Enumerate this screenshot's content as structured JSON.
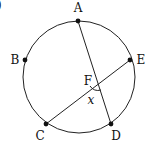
{
  "diagram": {
    "type": "circle-chords",
    "stroke_color": "#222222",
    "circle": {
      "cx": 79,
      "cy": 77,
      "r": 56
    },
    "points": [
      {
        "id": "A",
        "label": "A",
        "x": 78,
        "y": 21,
        "lx": 78,
        "ly": 12
      },
      {
        "id": "B",
        "label": "B",
        "x": 25,
        "y": 60,
        "lx": 15,
        "ly": 64
      },
      {
        "id": "E",
        "label": "E",
        "x": 130,
        "y": 60,
        "lx": 141,
        "ly": 64
      },
      {
        "id": "C",
        "label": "C",
        "x": 46,
        "y": 124,
        "lx": 40,
        "ly": 140
      },
      {
        "id": "D",
        "label": "D",
        "x": 111,
        "y": 124,
        "lx": 116,
        "ly": 140
      }
    ],
    "intersection": {
      "id": "F",
      "label": "F",
      "x": 98,
      "y": 80,
      "lx": 88,
      "ly": 85
    },
    "chords": [
      [
        "A",
        "D"
      ],
      [
        "C",
        "E"
      ]
    ],
    "angle": {
      "label": "x",
      "at": "F",
      "between": [
        "FC",
        "FD"
      ],
      "lx": 91,
      "ly": 104
    },
    "corner_mark": ")"
  }
}
